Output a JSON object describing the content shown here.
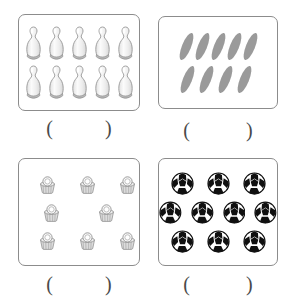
{
  "worksheet": {
    "title": "Counting objects worksheet",
    "background_color": "#ffffff",
    "box_border_color": "#8c8c8c"
  },
  "questions": [
    {
      "id": "q1",
      "object_name": "bowling-pin",
      "object_label": "bowling pin",
      "total_count": 10,
      "rows": [
        5,
        5
      ],
      "fill_color": "#f2f2f2",
      "outline_color": "#8a8a8a",
      "base_color": "#b8b8b8",
      "answer": {
        "open_paren": "(",
        "close_paren": ")",
        "value": ""
      }
    },
    {
      "id": "q2",
      "object_name": "leaf-ellipse",
      "object_label": "leaf",
      "total_count": 9,
      "rows": [
        5,
        4
      ],
      "fill_color": "#9a9a9a",
      "outline_color": "#9a9a9a",
      "rotation_degrees": 22,
      "answer": {
        "open_paren": "(",
        "close_paren": ")",
        "value": ""
      }
    },
    {
      "id": "q3",
      "object_name": "cupcake",
      "object_label": "cupcake",
      "total_count": 8,
      "rows": [
        3,
        2,
        3
      ],
      "fill_color": "#f0f0f0",
      "outline_color": "#888888",
      "base_color": "#cfcfcf",
      "answer": {
        "open_paren": "(",
        "close_paren": ")",
        "value": ""
      }
    },
    {
      "id": "q4",
      "object_name": "soccer-ball",
      "object_label": "soccer ball",
      "total_count": 10,
      "rows": [
        3,
        4,
        3
      ],
      "fill_color": "#ffffff",
      "patch_color": "#101010",
      "outline_color": "#101010",
      "answer": {
        "open_paren": "(",
        "close_paren": ")",
        "value": ""
      }
    }
  ]
}
